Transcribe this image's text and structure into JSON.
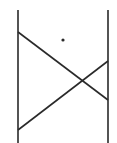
{
  "diagram": {
    "width": 117,
    "height": 143,
    "stroke_color": "#2a2a2a",
    "background": "#ffffff",
    "vertical_lines": [
      {
        "name": "left-post",
        "x": 18,
        "y1": 10,
        "y2": 143
      },
      {
        "name": "right-post",
        "x": 108,
        "y1": 10,
        "y2": 143
      }
    ],
    "diagonals": [
      {
        "name": "descending-diagonal",
        "x1": 18,
        "y1": 32,
        "x2": 108,
        "y2": 100
      },
      {
        "name": "ascending-diagonal",
        "x1": 18,
        "y1": 130,
        "x2": 108,
        "y2": 61
      }
    ],
    "dot": {
      "cx": 63,
      "cy": 40,
      "r": 1.6
    }
  }
}
